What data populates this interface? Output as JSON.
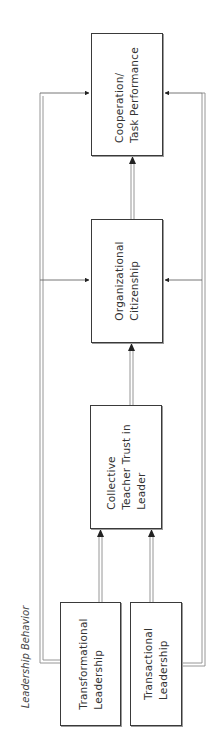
{
  "diagram": {
    "group_label": "Leadership Behavior",
    "nodes": [
      {
        "id": "cooperation",
        "label": "Cooperation/\nTask Performance"
      },
      {
        "id": "citizenship",
        "label": "Organizational\nCitizenship"
      },
      {
        "id": "trust",
        "label": "Collective\nTeacher Trust in\nLeader"
      },
      {
        "id": "transformational",
        "label": "Transformational\nLeadership"
      },
      {
        "id": "transactional",
        "label": "Transactional\nLeadership"
      }
    ],
    "edges": [
      {
        "from": "transformational",
        "to": "trust"
      },
      {
        "from": "transactional",
        "to": "trust"
      },
      {
        "from": "trust",
        "to": "citizenship"
      },
      {
        "from": "citizenship",
        "to": "cooperation"
      },
      {
        "from": "transformational",
        "to": "citizenship"
      },
      {
        "from": "transformational",
        "to": "cooperation"
      },
      {
        "from": "transactional",
        "to": "citizenship"
      },
      {
        "from": "transactional",
        "to": "cooperation"
      }
    ],
    "colors": {
      "line": "#8a8a8a",
      "border": "#3a3a3a",
      "arrow": "#222222"
    }
  }
}
